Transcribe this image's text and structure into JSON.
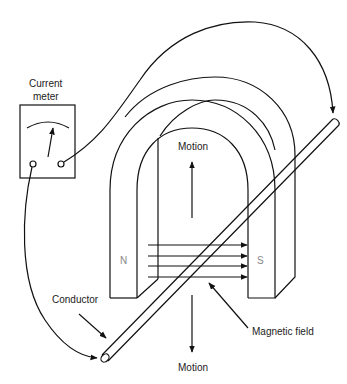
{
  "figure": {
    "labels": {
      "meter_line1": "Current",
      "meter_line2": "meter",
      "motion_up": "Motion",
      "motion_down": "Motion",
      "north_pole": "N",
      "south_pole": "S",
      "conductor": "Conductor",
      "magnetic_field": "Magnetic field"
    },
    "field_lines_count": 4,
    "colors": {
      "line": "#111111",
      "pole_text": "#888888",
      "background": "#ffffff"
    }
  }
}
